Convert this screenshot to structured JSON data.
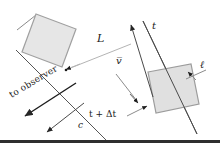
{
  "figure": {
    "kind": "physics-diagram",
    "topic": "relativistic-length-contraction",
    "background_color": "#ffffff",
    "line_color": "#3a3a3a",
    "box_fill_color": "#e3e3e3",
    "box_stroke_color": "#9a9a9a",
    "text_color": "#1a1a1a"
  },
  "labels": {
    "length_L": "L",
    "time_t": "t",
    "length_ell": "ℓ",
    "velocity_v": "v̅",
    "time_t_plus_delta_t_prefix": "t + ",
    "time_t_plus_delta_t_delta": "Δ",
    "time_t_plus_delta_t_suffix": "t",
    "time_t_plus_delta_t_full": "t + Δt",
    "light_speed_c": "c",
    "to_observer": "to observer"
  },
  "objects": {
    "box_left": {
      "name": "object-at-time-t-plus-delta-t",
      "points": "36,14 76,28 62,66 22,52"
    },
    "box_right": {
      "name": "object-at-time-t",
      "points": "148,73 192,65 200,105 156,113"
    }
  },
  "lines": {
    "wavefront_left": {
      "name": "wavefront-line-t-plus-delta-t",
      "x1": 16,
      "y1": 50,
      "x2": 104,
      "y2": 138
    },
    "wavefront_right": {
      "name": "wavefront-line-t",
      "x1": 142,
      "y1": 22,
      "x2": 196,
      "y2": 132
    },
    "connector_L": {
      "name": "length-L-connector",
      "x1": 64,
      "y1": 72,
      "x2": 132,
      "y2": 44
    }
  },
  "arrows": {
    "to_observer": {
      "name": "to-observer-arrow",
      "x1": 74,
      "y1": 84,
      "x2": 24,
      "y2": 116
    },
    "light_c": {
      "name": "light-speed-c-arrow",
      "x1": 82,
      "y1": 104,
      "x2": 46,
      "y2": 132
    },
    "velocity_v": {
      "name": "velocity-vector-arrow",
      "x1": 152,
      "y1": 96,
      "x2": 130,
      "y2": 24
    },
    "len_L_left": {
      "name": "length-L-left-arrowhead",
      "x1": 78,
      "y1": 64,
      "x2": 62,
      "y2": 70
    },
    "len_L_right": {
      "name": "length-L-right-arrowhead",
      "x1": 118,
      "y1": 52,
      "x2": 134,
      "y2": 44
    },
    "ell_arrow": {
      "name": "length-ell-arrow",
      "x1": 204,
      "y1": 70,
      "x2": 184,
      "y2": 80
    },
    "tdt_arrow": {
      "name": "time-label-arrow",
      "x1": 128,
      "y1": 118,
      "x2": 148,
      "y2": 108
    },
    "delta_arrow": {
      "name": "delta-t-pointer-arrow",
      "x1": 118,
      "y1": 112,
      "x2": 136,
      "y2": 104
    }
  }
}
